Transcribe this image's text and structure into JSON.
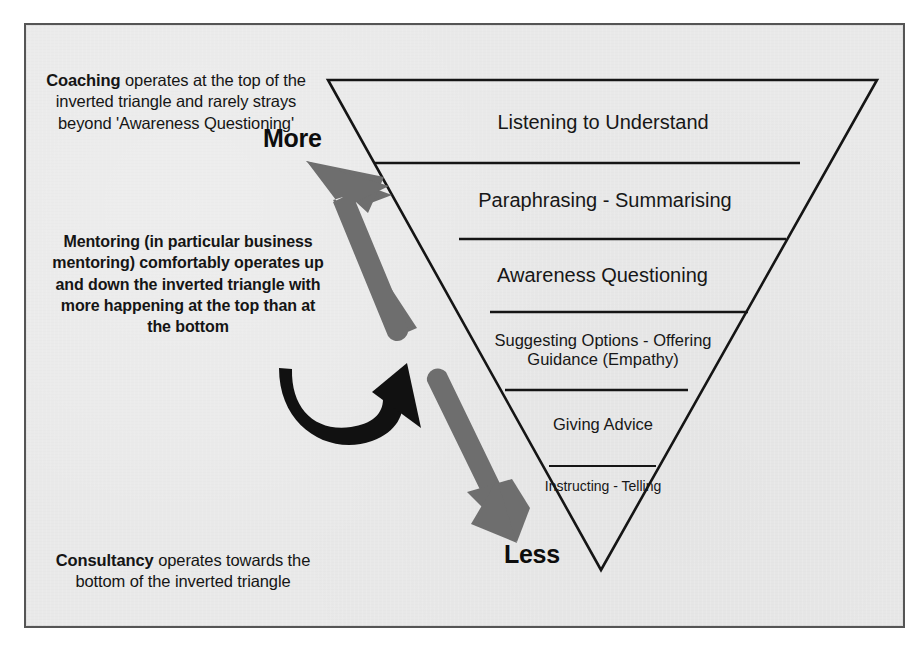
{
  "diagram": {
    "paper_color": "#e9e9e9",
    "border_color": "#555555",
    "ink_color": "#151515",
    "arrow_gray": "#6e6e6e",
    "arrow_black": "#111111"
  },
  "notes": {
    "coaching": {
      "lead": "Coaching",
      "body": " operates at the top of the inverted triangle and rarely strays beyond 'Awareness Questioning'"
    },
    "mentoring": {
      "text": "Mentoring (in particular business mentoring) comfortably operates up and down the inverted triangle with more happening at the top than at the bottom"
    },
    "consultancy": {
      "lead": "Consultancy",
      "body": " operates towards the bottom of the inverted triangle"
    }
  },
  "scale": {
    "top_label": "More",
    "bottom_label": "Less"
  },
  "triangle": {
    "tiers": [
      {
        "label": "Listening to Understand"
      },
      {
        "label": "Paraphrasing - Summarising"
      },
      {
        "label": "Awareness Questioning"
      },
      {
        "label": "Suggesting Options - Offering Guidance (Empathy)"
      },
      {
        "label": "Giving Advice"
      },
      {
        "label": "Instructing - Telling"
      }
    ]
  },
  "arrows": {
    "up": "up-arrow-more",
    "down": "down-arrow-less",
    "curve": "curved-loop-arrow"
  }
}
